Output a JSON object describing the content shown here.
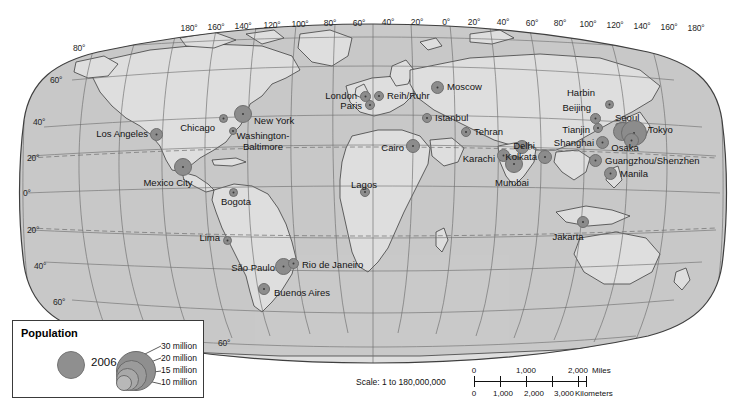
{
  "map": {
    "projection_name": "robinson-world",
    "title": "",
    "colors": {
      "ocean": "#c9c9c9",
      "land": "#dedede",
      "graticule": "#6e6e6e",
      "coastline": "#2b2b2b",
      "marker": "#8c8c8c",
      "marker_core": "#3a3a3a",
      "frame": "#3f3f3f",
      "page": "#ffffff"
    },
    "longitude_labels": [
      "180°",
      "160°",
      "140°",
      "120°",
      "100°",
      "80°",
      "60°",
      "40°",
      "20°",
      "0°",
      "20°",
      "40°",
      "60°",
      "80°",
      "100°",
      "120°",
      "140°",
      "160°",
      "180°"
    ],
    "latitude_labels_left": [
      "80°",
      "60°",
      "40°",
      "20°",
      "0°",
      "20°",
      "40°",
      "60°"
    ],
    "tropic_lines": [
      "Tropic of Cancer",
      "Tropic of Capricorn"
    ]
  },
  "legend": {
    "title": "Population",
    "year": "2006",
    "classes": [
      "30 million",
      "20 million",
      "15 million",
      "10 million"
    ]
  },
  "scale": {
    "ratio_text": "Scale: 1 to 180,000,000",
    "miles_ticks": [
      "0",
      "1,000",
      "2,000"
    ],
    "miles_unit": "Miles",
    "km_ticks": [
      "0",
      "1,000",
      "2,000",
      "3,000"
    ],
    "km_unit": "Kilometers"
  },
  "chart_data": {
    "type": "scatter",
    "xlabel": "Longitude",
    "ylabel": "Latitude",
    "value_unit": "million people",
    "cities": [
      {
        "name": "Los Angeles",
        "lon": -118.2,
        "lat": 34.1,
        "population": 17,
        "marker_px": 11,
        "x": 156,
        "y": 134,
        "label_side": "l",
        "label_x": 148,
        "label_y": 134
      },
      {
        "name": "Chicago",
        "lon": -87.6,
        "lat": 41.9,
        "population": 9,
        "marker_px": 7,
        "x": 223,
        "y": 118,
        "label_side": "l",
        "label_x": 215,
        "label_y": 128
      },
      {
        "name": "New York",
        "lon": -74.0,
        "lat": 40.7,
        "population": 22,
        "marker_px": 16,
        "x": 243,
        "y": 114,
        "label_side": "r",
        "label_x": 254,
        "label_y": 121
      },
      {
        "name": "Washington-Baltimore",
        "lon": -77.0,
        "lat": 39.0,
        "population": 8,
        "marker_px": 6,
        "x": 233,
        "y": 131,
        "label_side": "c",
        "label_x": 263,
        "label_y": 131
      },
      {
        "name": "Mexico City",
        "lon": -99.1,
        "lat": 19.4,
        "population": 22,
        "marker_px": 16,
        "x": 183,
        "y": 167,
        "label_side": "c",
        "label_x": 168,
        "label_y": 178
      },
      {
        "name": "Bogota",
        "lon": -74.1,
        "lat": 4.7,
        "population": 8,
        "marker_px": 7,
        "x": 233,
        "y": 192,
        "label_side": "c",
        "label_x": 236,
        "label_y": 197
      },
      {
        "name": "Lima",
        "lon": -77.0,
        "lat": -12.0,
        "population": 8,
        "marker_px": 7,
        "x": 227,
        "y": 240,
        "label_side": "l",
        "label_x": 220,
        "label_y": 238
      },
      {
        "name": "São Paulo",
        "lon": -46.6,
        "lat": -23.5,
        "population": 20,
        "marker_px": 15,
        "x": 283,
        "y": 266,
        "label_side": "l",
        "label_x": 275,
        "label_y": 268
      },
      {
        "name": "Rio de Janeiro",
        "lon": -43.2,
        "lat": -22.9,
        "population": 12,
        "marker_px": 9,
        "x": 293,
        "y": 263,
        "label_side": "r",
        "label_x": 302,
        "label_y": 265
      },
      {
        "name": "Buenos Aires",
        "lon": -58.4,
        "lat": -34.6,
        "population": 13,
        "marker_px": 10,
        "x": 264,
        "y": 289,
        "label_side": "r",
        "label_x": 274,
        "label_y": 293
      },
      {
        "name": "London",
        "lon": -0.1,
        "lat": 51.5,
        "population": 12,
        "marker_px": 9,
        "x": 365,
        "y": 96,
        "label_side": "l",
        "label_x": 357,
        "label_y": 96
      },
      {
        "name": "Paris",
        "lon": 2.3,
        "lat": 48.9,
        "population": 10,
        "marker_px": 8,
        "x": 370,
        "y": 105,
        "label_side": "l",
        "label_x": 362,
        "label_y": 106
      },
      {
        "name": "Reih/Ruhr",
        "lon": 7.0,
        "lat": 51.3,
        "population": 11,
        "marker_px": 8,
        "x": 379,
        "y": 96,
        "label_side": "r",
        "label_x": 387,
        "label_y": 96
      },
      {
        "name": "Moscow",
        "lon": 37.6,
        "lat": 55.8,
        "population": 12,
        "marker_px": 11,
        "x": 437,
        "y": 87,
        "label_side": "r",
        "label_x": 447,
        "label_y": 87
      },
      {
        "name": "Istanbul",
        "lon": 29.0,
        "lat": 41.0,
        "population": 10,
        "marker_px": 8,
        "x": 427,
        "y": 118,
        "label_side": "r",
        "label_x": 435,
        "label_y": 118
      },
      {
        "name": "Cairo",
        "lon": 31.2,
        "lat": 30.0,
        "population": 16,
        "marker_px": 12,
        "x": 413,
        "y": 146,
        "label_side": "l",
        "label_x": 404,
        "label_y": 148
      },
      {
        "name": "Lagos",
        "lon": 3.4,
        "lat": 6.5,
        "population": 11,
        "marker_px": 8,
        "x": 365,
        "y": 192,
        "label_side": "c",
        "label_x": 364,
        "label_y": 180
      },
      {
        "name": "Tehran",
        "lon": 51.4,
        "lat": 35.7,
        "population": 12,
        "marker_px": 8,
        "x": 466,
        "y": 132,
        "label_side": "r",
        "label_x": 474,
        "label_y": 132
      },
      {
        "name": "Karachi",
        "lon": 67.0,
        "lat": 24.9,
        "population": 14,
        "marker_px": 11,
        "x": 503,
        "y": 155,
        "label_side": "l",
        "label_x": 495,
        "label_y": 159
      },
      {
        "name": "Delhi",
        "lon": 77.2,
        "lat": 28.6,
        "population": 17,
        "marker_px": 12,
        "x": 522,
        "y": 147,
        "label_side": "c",
        "label_x": 524,
        "label_y": 141
      },
      {
        "name": "Mumbai",
        "lon": 72.9,
        "lat": 19.1,
        "population": 19,
        "marker_px": 16,
        "x": 514,
        "y": 164,
        "label_side": "c",
        "label_x": 512,
        "label_y": 178
      },
      {
        "name": "Kolkata",
        "lon": 88.4,
        "lat": 22.6,
        "population": 15,
        "marker_px": 12,
        "x": 545,
        "y": 157,
        "label_side": "l",
        "label_x": 537,
        "label_y": 157
      },
      {
        "name": "Harbin",
        "lon": 126.6,
        "lat": 45.8,
        "population": 9,
        "marker_px": 7,
        "x": 609,
        "y": 104,
        "label_side": "r",
        "label_x": 567,
        "label_y": 93
      },
      {
        "name": "Beijing",
        "lon": 116.4,
        "lat": 39.9,
        "population": 12,
        "marker_px": 9,
        "x": 595,
        "y": 118,
        "label_side": "l",
        "label_x": 591,
        "label_y": 108
      },
      {
        "name": "Tianjin",
        "lon": 117.2,
        "lat": 39.1,
        "population": 10,
        "marker_px": 8,
        "x": 598,
        "y": 128,
        "label_side": "l",
        "label_x": 590,
        "label_y": 130
      },
      {
        "name": "Shanghai",
        "lon": 121.5,
        "lat": 31.2,
        "population": 15,
        "marker_px": 11,
        "x": 602,
        "y": 142,
        "label_side": "l",
        "label_x": 594,
        "label_y": 143
      },
      {
        "name": "Seoul",
        "lon": 127.0,
        "lat": 37.6,
        "population": 22,
        "marker_px": 17,
        "x": 622,
        "y": 131,
        "label_side": "r",
        "label_x": 615,
        "label_y": 118
      },
      {
        "name": "Tokyo",
        "lon": 139.7,
        "lat": 35.7,
        "population": 34,
        "marker_px": 24,
        "x": 634,
        "y": 133,
        "label_side": "r",
        "label_x": 648,
        "label_y": 130
      },
      {
        "name": "Osaka",
        "lon": 135.5,
        "lat": 34.7,
        "population": 17,
        "marker_px": 13,
        "x": 631,
        "y": 140,
        "label_side": "c",
        "label_x": 625,
        "label_y": 143
      },
      {
        "name": "Guangzhou/Shenzhen",
        "lon": 113.3,
        "lat": 23.1,
        "population": 13,
        "marker_px": 11,
        "x": 595,
        "y": 160,
        "label_side": "r",
        "label_x": 605,
        "label_y": 161
      },
      {
        "name": "Manila",
        "lon": 121.0,
        "lat": 14.6,
        "population": 15,
        "marker_px": 11,
        "x": 610,
        "y": 173,
        "label_side": "r",
        "label_x": 620,
        "label_y": 174
      },
      {
        "name": "Jakarta",
        "lon": 106.8,
        "lat": -6.2,
        "population": 13,
        "marker_px": 10,
        "x": 583,
        "y": 222,
        "label_side": "c",
        "label_x": 568,
        "label_y": 232
      }
    ]
  }
}
